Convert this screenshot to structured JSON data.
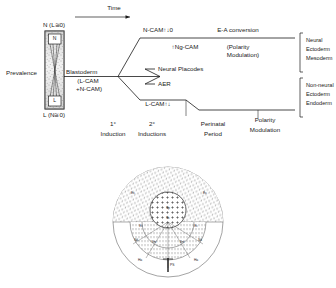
{
  "figure": {
    "top_panel": {
      "time_axis_label": "Time",
      "y_axis_label": "Prevalence",
      "gradient_box": {
        "top_label": "N (L≅0)",
        "bottom_label": "L (N≅0)",
        "inner_top_letter": "N",
        "inner_bottom_letter": "L"
      },
      "origin_label_line1": "Blastoderm",
      "origin_label_line2": "(L-CAM",
      "origin_label_line3": "+N-CAM)",
      "top_branch": {
        "label": "N-CAM↑↓0",
        "secondary_label": "↑Ng-CAM",
        "right_label": "E-A conversion",
        "right_sub_line1": "(Polarity",
        "right_sub_line2": "Modulation)"
      },
      "middle_branch": {
        "label_1": "Neural Placodes",
        "label_2": "AER"
      },
      "bottom_branch": {
        "label": "L-CAM↑↓"
      },
      "right_brackets": [
        {
          "lines": [
            "Neural",
            "Ectoderm",
            "Mesoderm"
          ]
        },
        {
          "lines": [
            "Non-neural",
            "Ectoderm",
            "Endoderm"
          ]
        }
      ],
      "time_ticks": [
        {
          "line1": "1°",
          "line2": "Induction"
        },
        {
          "line1": "2°",
          "line2": "Inductions"
        },
        {
          "line1": "Perinatal",
          "line2": "Period"
        },
        {
          "line1": "Polarity",
          "line2": "Modulation"
        }
      ]
    },
    "bottom_panel": {
      "description": "circular blastoderm fate map",
      "quadrant_labels": [
        "Ec",
        "Ec"
      ],
      "center_labels": [
        "Np",
        "Nc"
      ],
      "inner_labels": [
        "Ec",
        "Ec",
        "Nd",
        "Sm",
        "Sm",
        "Nd"
      ],
      "lower_labels": [
        "Ha",
        "Ha"
      ],
      "streak_label": "PS"
    }
  },
  "colors": {
    "ink": "#1a1a1a",
    "stipple": "#4a4a4a",
    "background": "#ffffff"
  }
}
